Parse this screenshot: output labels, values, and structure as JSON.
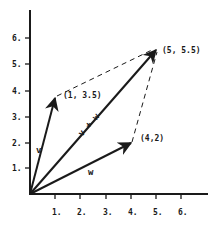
{
  "diagram": {
    "colors": {
      "ink": "#1a1a1a",
      "background": "#ffffff"
    },
    "axes": {
      "x_ticks": [
        "1.",
        "2.",
        "3.",
        "4.",
        "5.",
        "6."
      ],
      "y_ticks": [
        "1.",
        "2.",
        "3.",
        "4.",
        "5.",
        "6."
      ]
    },
    "vectors": [
      {
        "name": "v",
        "label": "v",
        "tip": [
          1,
          3.5
        ],
        "tip_label": "(1, 3.5)"
      },
      {
        "name": "w",
        "label": "w",
        "tip": [
          4,
          2
        ],
        "tip_label": "(4,2)"
      },
      {
        "name": "v_plus_w",
        "label": "v + w",
        "tip": [
          5,
          5.5
        ],
        "tip_label": "(5, 5.5)"
      }
    ],
    "dashed_edges": [
      {
        "from": [
          1,
          3.5
        ],
        "to": [
          5,
          5.5
        ]
      },
      {
        "from": [
          4,
          2
        ],
        "to": [
          5,
          5.5
        ]
      }
    ]
  }
}
